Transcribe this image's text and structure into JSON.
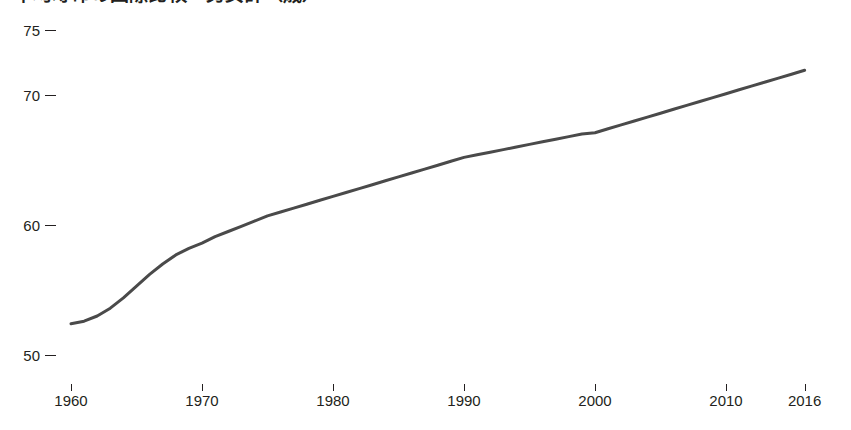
{
  "chart_data": {
    "type": "line",
    "title": "平均寿命の国際比較・男女計（歳）",
    "subtitle": "",
    "xlabel": "",
    "ylabel": "",
    "xlim": [
      1960,
      2016
    ],
    "ylim": [
      48,
      76
    ],
    "grid": false,
    "legend": "none",
    "line_color": "#4a4a4a",
    "line_width": 3,
    "x_ticks": [
      1960,
      1970,
      1980,
      1990,
      2000,
      2010,
      2016
    ],
    "x_tick_labels": [
      "1960",
      "1970",
      "1980",
      "1990",
      "2000",
      "2010",
      "2016"
    ],
    "y_ticks": [
      50,
      60,
      70,
      75
    ],
    "y_tick_labels": [
      "50",
      "60",
      "70",
      "75"
    ],
    "x": [
      1960,
      1961,
      1962,
      1963,
      1964,
      1965,
      1966,
      1967,
      1968,
      1969,
      1970,
      1971,
      1972,
      1973,
      1974,
      1975,
      1976,
      1977,
      1978,
      1979,
      1980,
      1981,
      1982,
      1983,
      1984,
      1985,
      1986,
      1987,
      1988,
      1989,
      1990,
      1991,
      1992,
      1993,
      1994,
      1995,
      1996,
      1997,
      1998,
      1999,
      2000,
      2001,
      2002,
      2003,
      2004,
      2005,
      2006,
      2007,
      2008,
      2009,
      2010,
      2011,
      2012,
      2013,
      2014,
      2015,
      2016
    ],
    "values": [
      52.4,
      52.6,
      53.0,
      53.6,
      54.4,
      55.3,
      56.2,
      57.0,
      57.7,
      58.2,
      58.6,
      59.1,
      59.5,
      59.9,
      60.3,
      60.7,
      61.0,
      61.3,
      61.6,
      61.9,
      62.2,
      62.5,
      62.8,
      63.1,
      63.4,
      63.7,
      64.0,
      64.3,
      64.6,
      64.9,
      65.2,
      65.4,
      65.6,
      65.8,
      66.0,
      66.2,
      66.4,
      66.6,
      66.8,
      67.0,
      67.1,
      67.4,
      67.7,
      68.0,
      68.3,
      68.6,
      68.9,
      69.2,
      69.5,
      69.8,
      70.1,
      70.4,
      70.7,
      71.0,
      71.3,
      71.6,
      71.9
    ],
    "series": [
      {
        "name": "平均寿命",
        "values": [
          52.4,
          52.6,
          53.0,
          53.6,
          54.4,
          55.3,
          56.2,
          57.0,
          57.7,
          58.2,
          58.6,
          59.1,
          59.5,
          59.9,
          60.3,
          60.7,
          61.0,
          61.3,
          61.6,
          61.9,
          62.2,
          62.5,
          62.8,
          63.1,
          63.4,
          63.7,
          64.0,
          64.3,
          64.6,
          64.9,
          65.2,
          65.4,
          65.6,
          65.8,
          66.0,
          66.2,
          66.4,
          66.6,
          66.8,
          67.0,
          67.1,
          67.4,
          67.7,
          68.0,
          68.3,
          68.6,
          68.9,
          69.2,
          69.5,
          69.8,
          70.1,
          70.4,
          70.7,
          71.0,
          71.3,
          71.6,
          71.9
        ]
      }
    ]
  }
}
